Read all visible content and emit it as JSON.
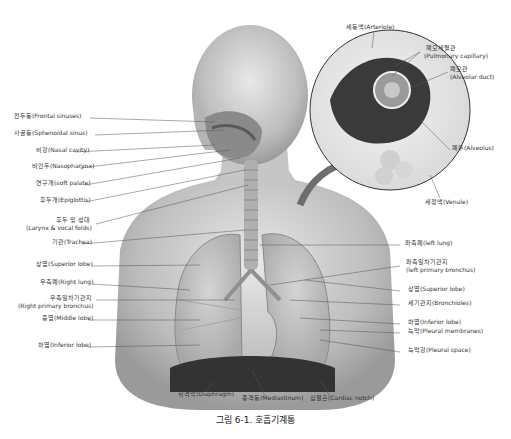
{
  "figure": {
    "caption": "그림 6-1. 호흡기계통"
  },
  "labels_left": [
    {
      "id": "frontal-sinuses",
      "text": "전두동(Frontal sinuses)",
      "x": 14,
      "y": 116
    },
    {
      "id": "sphenoidal-sinus",
      "text": "사골동(Sphenoidal sinus)",
      "x": 14,
      "y": 133
    },
    {
      "id": "nasal-cavity",
      "text": "비강(Nasal cavity)",
      "x": 36,
      "y": 150
    },
    {
      "id": "nasopharynx",
      "text": "비인두(Nasopharynx)",
      "x": 32,
      "y": 166
    },
    {
      "id": "soft-palate",
      "text": "연구개(soft palate)",
      "x": 36,
      "y": 183
    },
    {
      "id": "epiglottis",
      "text": "후두개(Epiglottis)",
      "x": 40,
      "y": 200
    },
    {
      "id": "larynx-line1",
      "text": "후두 및 성대",
      "x": 56,
      "y": 220
    },
    {
      "id": "larynx-line2",
      "text": "(Larynx & vocal folds)",
      "x": 26,
      "y": 228
    },
    {
      "id": "trachea",
      "text": "기관(Trachea)",
      "x": 52,
      "y": 242
    },
    {
      "id": "superior-lobe-right",
      "text": "상엽(Superior lobe)",
      "x": 36,
      "y": 264
    },
    {
      "id": "right-lung",
      "text": "우측폐(Right lung)",
      "x": 40,
      "y": 282
    },
    {
      "id": "right-bronchus-line1",
      "text": "우측일차기관지",
      "x": 50,
      "y": 298
    },
    {
      "id": "right-bronchus-line2",
      "text": "(Right primary bronchus)",
      "x": 18,
      "y": 306
    },
    {
      "id": "middle-lobe",
      "text": "중엽(Middle lobe)",
      "x": 42,
      "y": 318
    },
    {
      "id": "inferior-lobe-right",
      "text": "하엽(Inferior lobe)",
      "x": 38,
      "y": 345
    }
  ],
  "labels_right": [
    {
      "id": "arteriole",
      "text": "세동맥(Arteriole)",
      "x": 346,
      "y": 27
    },
    {
      "id": "pulmonary-capillary-1",
      "text": "폐모세혈관",
      "x": 426,
      "y": 48
    },
    {
      "id": "pulmonary-capillary-2",
      "text": "(Pulmonary capillary)",
      "x": 424,
      "y": 56
    },
    {
      "id": "alveolar-duct-1",
      "text": "폐모관",
      "x": 450,
      "y": 69
    },
    {
      "id": "alveolar-duct-2",
      "text": "(Alveolar duct)",
      "x": 450,
      "y": 77
    },
    {
      "id": "alveolus",
      "text": "폐우(Alveolus)",
      "x": 452,
      "y": 148
    },
    {
      "id": "venule",
      "text": "세정맥(Venule)",
      "x": 425,
      "y": 202
    },
    {
      "id": "left-lung",
      "text": "좌측폐(left lung)",
      "x": 405,
      "y": 243
    },
    {
      "id": "left-bronchus-1",
      "text": "좌측일차기관지",
      "x": 406,
      "y": 262
    },
    {
      "id": "left-bronchus-2",
      "text": "(left primary bronchus)",
      "x": 406,
      "y": 270
    },
    {
      "id": "superior-lobe-left",
      "text": "상엽(Superior lobe)",
      "x": 408,
      "y": 289
    },
    {
      "id": "bronchioles",
      "text": "세기관지(Bronchioles)",
      "x": 408,
      "y": 303
    },
    {
      "id": "inferior-lobe-left",
      "text": "하엽(Inferior lobe)",
      "x": 408,
      "y": 322
    },
    {
      "id": "pleural-membranes",
      "text": "늑막(Pleural membranes)",
      "x": 408,
      "y": 331
    },
    {
      "id": "pleural-space",
      "text": "늑막강(Pleural space)",
      "x": 408,
      "y": 350
    }
  ],
  "labels_bottom": [
    {
      "id": "diaphragm",
      "text": "횡격막(Diaphragm)",
      "x": 178,
      "y": 394
    },
    {
      "id": "mediastinum",
      "text": "종격동(Mediastinum)",
      "x": 242,
      "y": 398
    },
    {
      "id": "cardiac-notch",
      "text": "심절흔(Cardiac notch)",
      "x": 310,
      "y": 398
    }
  ]
}
